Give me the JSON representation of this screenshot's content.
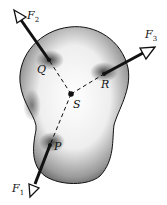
{
  "diagram": {
    "type": "rigid body with three concurrent forces",
    "points": [
      {
        "id": "S",
        "label": "S",
        "x": 71,
        "y": 94
      },
      {
        "id": "Q",
        "label": "Q",
        "x": 49,
        "y": 60
      },
      {
        "id": "R",
        "label": "R",
        "x": 104,
        "y": 74
      },
      {
        "id": "P",
        "label": "P",
        "x": 50,
        "y": 145
      }
    ],
    "forces": [
      {
        "id": "F1",
        "symbol": "F",
        "subscript": "1",
        "applied_at": "P"
      },
      {
        "id": "F2",
        "symbol": "F",
        "subscript": "2",
        "applied_at": "Q"
      },
      {
        "id": "F3",
        "symbol": "F",
        "subscript": "3",
        "applied_at": "R"
      }
    ],
    "dashed_lines": [
      "S-Q",
      "S-R",
      "S-P"
    ],
    "colors": {
      "body_dark": "#3a3a3a",
      "body_light": "#ffffff",
      "ink": "#111111"
    }
  }
}
